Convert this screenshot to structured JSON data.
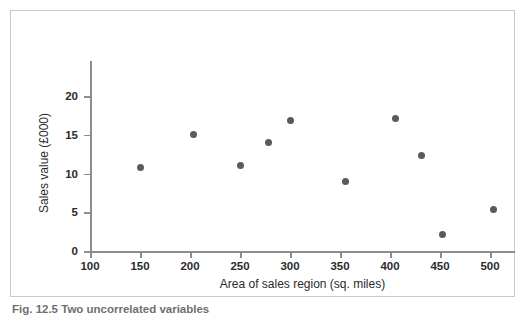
{
  "figure": {
    "caption": "Fig. 12.5  Two uncorrelated variables"
  },
  "chart_data": {
    "type": "scatter",
    "title": "",
    "xlabel": "Area of sales region (sq. miles)",
    "ylabel": "Sales value (£000)",
    "xlim": [
      100,
      525
    ],
    "ylim": [
      0,
      23
    ],
    "xticks": [
      100,
      150,
      200,
      250,
      300,
      350,
      400,
      450,
      500
    ],
    "yticks": [
      0,
      5,
      10,
      15,
      20
    ],
    "xticklabels": [
      "100",
      "150",
      "200",
      "250",
      "300",
      "350",
      "400",
      "450",
      "500"
    ],
    "yticklabels": [
      "0",
      "5",
      "10",
      "15",
      "20"
    ],
    "grid": false,
    "legend": false,
    "marker_color": "#5a5a5e",
    "axis_color": "#8d8d8d",
    "points": [
      {
        "x": 150,
        "y": 10.8
      },
      {
        "x": 203,
        "y": 15.0
      },
      {
        "x": 250,
        "y": 11.0
      },
      {
        "x": 278,
        "y": 14.0
      },
      {
        "x": 300,
        "y": 16.9
      },
      {
        "x": 355,
        "y": 9.0
      },
      {
        "x": 405,
        "y": 17.1
      },
      {
        "x": 431,
        "y": 12.3
      },
      {
        "x": 452,
        "y": 2.1
      },
      {
        "x": 503,
        "y": 5.4
      }
    ]
  }
}
